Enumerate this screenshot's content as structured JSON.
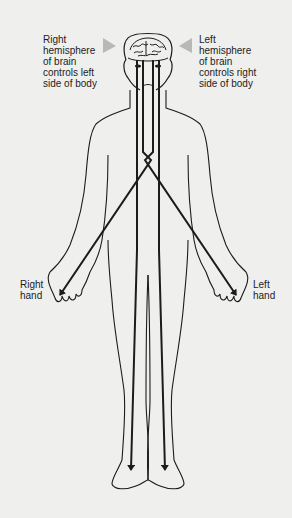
{
  "diagram": {
    "labels": {
      "right_hemisphere": "Right\nhemisphere\nof brain\ncontrols left\nside of body",
      "left_hemisphere": "Left\nhemisphere\nof brain\ncontrols right\nside of body",
      "right_hand": "Right\nhand",
      "left_hand": "Left\nhand"
    },
    "elements": [
      "human-figure-outline",
      "brain",
      "nerve-paths-to-hands",
      "nerve-paths-to-feet",
      "pointer-triangles"
    ],
    "colors": {
      "background": "#efefed",
      "ink": "#1c1c1c",
      "pointer": "#b8b8b8"
    }
  }
}
